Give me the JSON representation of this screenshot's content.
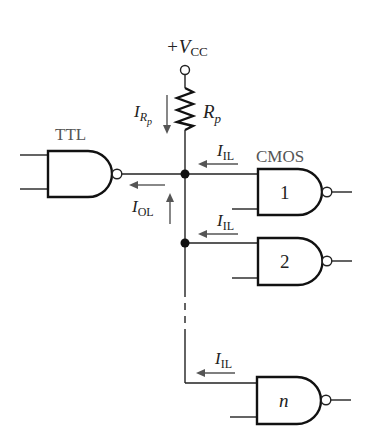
{
  "diagram": {
    "supply": {
      "prefix": "+V",
      "subscript": "CC"
    },
    "resistor": {
      "label": "R",
      "subscript": "p"
    },
    "currents": {
      "resistor_current": {
        "label": "I",
        "subscript": "R",
        "subsub": "p"
      },
      "output_low": {
        "label": "I",
        "subscript": "OL"
      },
      "input_low": {
        "label": "I",
        "subscript": "IL"
      }
    },
    "driver": {
      "label": "TTL"
    },
    "loads_label": "CMOS",
    "gates": [
      {
        "id": "1",
        "label": "1"
      },
      {
        "id": "2",
        "label": "2"
      },
      {
        "id": "n",
        "label": "n"
      }
    ],
    "colors": {
      "line": "#222222",
      "arrow": "#555555",
      "background": "#ffffff"
    }
  }
}
